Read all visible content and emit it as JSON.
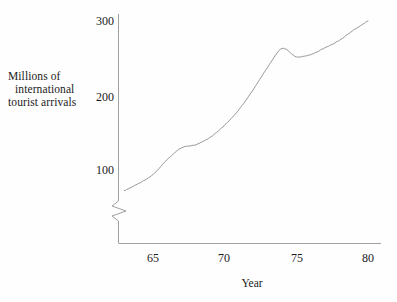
{
  "figure": {
    "background_color": "#fefefe",
    "line_color": "#8c8c8c",
    "axis_color": "#9a9a9a",
    "text_color": "#1b1b1b"
  },
  "labels": {
    "y_axis_line1": "Millions of",
    "y_axis_line2": "international",
    "y_axis_line3": "tourist arrivals",
    "x_axis": "Year"
  },
  "ticks": {
    "y": [
      "100",
      "200",
      "300"
    ],
    "x": [
      "65",
      "70",
      "75",
      "80"
    ]
  },
  "chart_data": {
    "type": "line",
    "title": "",
    "xlabel": "Year",
    "ylabel": "Millions of international tourist arrivals",
    "xlim": [
      63,
      80
    ],
    "ylim": [
      60,
      305
    ],
    "y_axis_break": true,
    "y_axis_break_note": "zigzag break between 0 and ~60 on the vertical axis",
    "grid": false,
    "legend": null,
    "x_tick_values": [
      65,
      70,
      75,
      80
    ],
    "y_tick_values": [
      100,
      200,
      300
    ],
    "series": [
      {
        "name": "International tourist arrivals",
        "x": [
          63,
          64,
          65,
          66,
          67,
          68,
          69,
          70,
          71,
          72,
          73,
          74,
          75,
          76,
          77,
          78,
          79,
          80
        ],
        "values": [
          72,
          82,
          94,
          114,
          130,
          134,
          144,
          160,
          181,
          208,
          238,
          263,
          252,
          255,
          264,
          274,
          288,
          300
        ]
      }
    ],
    "annotations": [
      {
        "text": "local peak then dip around 1973-1974",
        "x": 73.5,
        "y": 258
      }
    ]
  }
}
